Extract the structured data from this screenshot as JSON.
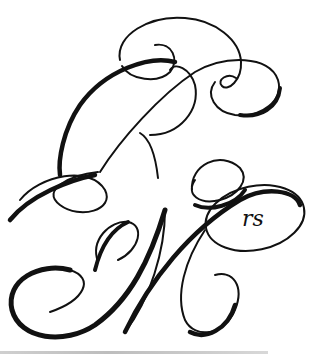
{
  "image": {
    "description": "Calligraphic monogram with flourished letters",
    "letters": [
      "R",
      "M"
    ],
    "superscript": "rs",
    "ink_color": "#111111",
    "background_color": "#ffffff"
  }
}
